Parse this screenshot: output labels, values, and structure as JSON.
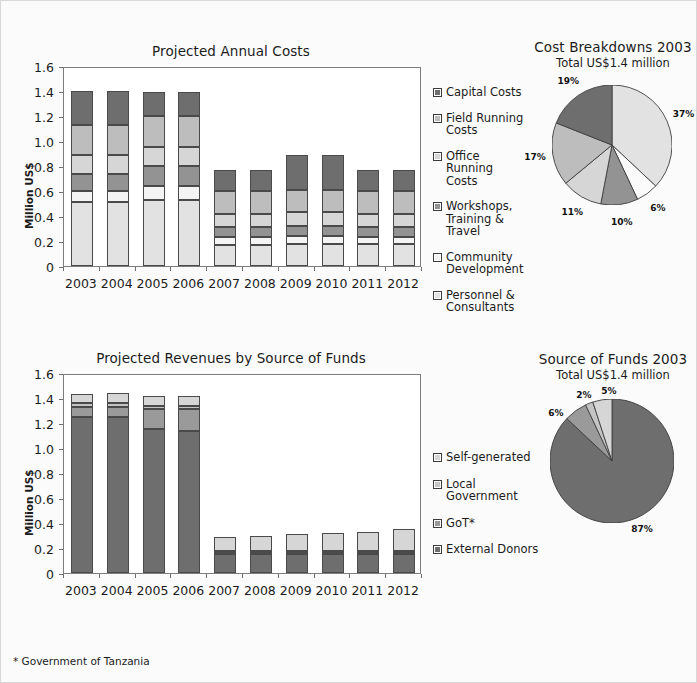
{
  "page": {
    "background": "#fbfbfb",
    "footnote": "* Government of Tanzania"
  },
  "palette": {
    "capital_costs": "#6e6e6e",
    "field_running": "#bdbdbd",
    "office_running": "#d6d6d6",
    "workshops": "#939393",
    "community_dev": "#f4f4f4",
    "personnel": "#e2e2e2",
    "self_generated": "#d6d6d6",
    "local_government": "#c4c4c4",
    "got": "#9a9a9a",
    "external_donors": "#6e6e6e",
    "stroke": "#4a4a4a",
    "axis": "#7d7d7d"
  },
  "costs_chart": {
    "title": "Projected Annual Costs",
    "ylabel": "Million US$",
    "yticks": [
      "1.6",
      "1.4",
      "1.2",
      "1.0",
      "0.8",
      "0.6",
      "0.4",
      "0.2",
      "0"
    ],
    "categories": [
      "2003",
      "2004",
      "2005",
      "2006",
      "2007",
      "2008",
      "2009",
      "2010",
      "2011",
      "2012"
    ]
  },
  "revenue_chart": {
    "title": "Projected Revenues by Source of Funds",
    "ylabel": "Million US$",
    "yticks": [
      "1.6",
      "1.4",
      "1.2",
      "1.0",
      "0.8",
      "0.6",
      "0.4",
      "0.2",
      "0"
    ],
    "categories": [
      "2003",
      "2004",
      "2005",
      "2006",
      "2007",
      "2008",
      "2009",
      "2010",
      "2011",
      "2012"
    ]
  },
  "costs_legend": [
    {
      "label": "Capital Costs",
      "color": "#6e6e6e"
    },
    {
      "label": "Field Running\nCosts",
      "color": "#bdbdbd"
    },
    {
      "label": "Office Running\nCosts",
      "color": "#d6d6d6"
    },
    {
      "label": "Workshops,\nTraining & Travel",
      "color": "#939393"
    },
    {
      "label": "Community\nDevelopment",
      "color": "#f4f4f4"
    },
    {
      "label": "Personnel &\nConsultants",
      "color": "#e2e2e2"
    }
  ],
  "revenue_legend": [
    {
      "label": "Self-generated",
      "color": "#d6d6d6"
    },
    {
      "label": "Local Government",
      "color": "#c4c4c4"
    },
    {
      "label": "GoT*",
      "color": "#9a9a9a"
    },
    {
      "label": "External Donors",
      "color": "#6e6e6e"
    }
  ],
  "costs_pie": {
    "title": "Cost Breakdowns 2003",
    "subtitle": "Total US$1.4 million"
  },
  "revenue_pie": {
    "title": "Source of Funds 2003",
    "subtitle": "Total US$1.4 million"
  },
  "chart_data": [
    {
      "type": "bar",
      "id": "projected-annual-costs",
      "title": "Projected Annual Costs",
      "xlabel": "",
      "ylabel": "Million US$",
      "ylim": [
        0,
        1.6
      ],
      "ytick_values": [
        0,
        0.2,
        0.4,
        0.6,
        0.8,
        1.0,
        1.2,
        1.4,
        1.6
      ],
      "grid": false,
      "legend": "right",
      "stacked": true,
      "unit": "Million US$",
      "categories": [
        "2003",
        "2004",
        "2005",
        "2006",
        "2007",
        "2008",
        "2009",
        "2010",
        "2011",
        "2012"
      ],
      "series": [
        {
          "name": "Personnel & Consultants",
          "color": "#e2e2e2",
          "values": [
            0.51,
            0.51,
            0.53,
            0.53,
            0.17,
            0.17,
            0.18,
            0.18,
            0.18,
            0.18
          ]
        },
        {
          "name": "Community Development",
          "color": "#f4f4f4",
          "values": [
            0.09,
            0.09,
            0.11,
            0.11,
            0.06,
            0.06,
            0.06,
            0.06,
            0.05,
            0.05
          ]
        },
        {
          "name": "Workshops, Training & Travel",
          "color": "#939393",
          "values": [
            0.14,
            0.14,
            0.16,
            0.16,
            0.08,
            0.08,
            0.08,
            0.08,
            0.08,
            0.08
          ]
        },
        {
          "name": "Office Running Costs",
          "color": "#d6d6d6",
          "values": [
            0.15,
            0.15,
            0.15,
            0.15,
            0.11,
            0.11,
            0.11,
            0.11,
            0.11,
            0.11
          ]
        },
        {
          "name": "Field Running Costs",
          "color": "#bdbdbd",
          "values": [
            0.24,
            0.24,
            0.25,
            0.25,
            0.18,
            0.18,
            0.18,
            0.18,
            0.18,
            0.18
          ]
        },
        {
          "name": "Capital Costs",
          "color": "#6e6e6e",
          "values": [
            0.27,
            0.27,
            0.19,
            0.19,
            0.17,
            0.17,
            0.28,
            0.28,
            0.17,
            0.17
          ]
        }
      ],
      "totals": [
        1.4,
        1.4,
        1.39,
        1.39,
        0.77,
        0.77,
        0.89,
        0.89,
        0.77,
        0.77
      ]
    },
    {
      "type": "pie",
      "id": "cost-breakdowns-2003",
      "title": "Cost Breakdowns 2003",
      "subtitle": "Total US$1.4 million",
      "start_angle_deg": 0,
      "direction": "clockwise",
      "labels": [
        "Personnel & Consultants",
        "Community Development",
        "Workshops, Training & Travel",
        "Office Running Costs",
        "Field Running Costs",
        "Capital Costs"
      ],
      "values": [
        37,
        6,
        10,
        11,
        17,
        19
      ],
      "value_labels": [
        "37%",
        "6%",
        "10%",
        "11%",
        "17%",
        "19%"
      ],
      "colors": [
        "#e2e2e2",
        "#fbfbfb",
        "#939393",
        "#d6d6d6",
        "#bdbdbd",
        "#6e6e6e"
      ]
    },
    {
      "type": "bar",
      "id": "projected-revenues-by-source-of-funds",
      "title": "Projected Revenues by Source of Funds",
      "xlabel": "",
      "ylabel": "Million US$",
      "ylim": [
        0,
        1.6
      ],
      "ytick_values": [
        0,
        0.2,
        0.4,
        0.6,
        0.8,
        1.0,
        1.2,
        1.4,
        1.6
      ],
      "grid": false,
      "legend": "right",
      "stacked": true,
      "unit": "Million US$",
      "categories": [
        "2003",
        "2004",
        "2005",
        "2006",
        "2007",
        "2008",
        "2009",
        "2010",
        "2011",
        "2012"
      ],
      "series": [
        {
          "name": "External Donors",
          "color": "#6e6e6e",
          "values": [
            1.25,
            1.25,
            1.15,
            1.14,
            0.15,
            0.15,
            0.15,
            0.15,
            0.15,
            0.15
          ]
        },
        {
          "name": "GoT*",
          "color": "#9a9a9a",
          "values": [
            0.08,
            0.08,
            0.16,
            0.17,
            0.02,
            0.02,
            0.02,
            0.02,
            0.02,
            0.02
          ]
        },
        {
          "name": "Local Government",
          "color": "#c4c4c4",
          "values": [
            0.03,
            0.03,
            0.03,
            0.03,
            0.01,
            0.01,
            0.01,
            0.01,
            0.01,
            0.01
          ]
        },
        {
          "name": "Self-generated",
          "color": "#d6d6d6",
          "values": [
            0.07,
            0.08,
            0.08,
            0.08,
            0.11,
            0.12,
            0.13,
            0.14,
            0.15,
            0.17
          ]
        }
      ],
      "totals": [
        1.43,
        1.44,
        1.42,
        1.42,
        0.29,
        0.3,
        0.31,
        0.32,
        0.33,
        0.35
      ]
    },
    {
      "type": "pie",
      "id": "source-of-funds-2003",
      "title": "Source of Funds 2003",
      "subtitle": "Total US$1.4 million",
      "start_angle_deg": 0,
      "direction": "clockwise",
      "labels": [
        "External Donors",
        "GoT*",
        "Local Government",
        "Self-generated"
      ],
      "values": [
        87,
        6,
        2,
        5
      ],
      "value_labels": [
        "87%",
        "6%",
        "2%",
        "5%"
      ],
      "colors": [
        "#6e6e6e",
        "#9a9a9a",
        "#c4c4c4",
        "#d6d6d6"
      ]
    }
  ]
}
